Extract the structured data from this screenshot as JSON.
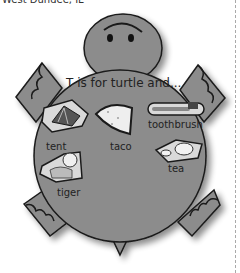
{
  "header": {
    "location": "West Dundee, IL"
  },
  "turtle": {
    "title": "T is for turtle and...",
    "items": [
      {
        "label": "tent"
      },
      {
        "label": "taco"
      },
      {
        "label": "toothbrush"
      },
      {
        "label": "tea"
      },
      {
        "label": "tiger"
      }
    ],
    "colors": {
      "body": "#8c8c8c",
      "outline": "#1a1a1a",
      "shadow": "#cccccc"
    }
  }
}
